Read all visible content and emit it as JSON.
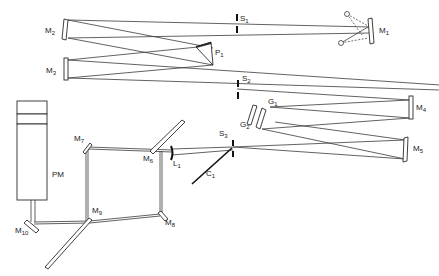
{
  "diagram": {
    "type": "optical-layout",
    "colors": {
      "line": "#3a3a3a",
      "background": "#ffffff",
      "label": "#1a1a1a"
    },
    "components": {
      "M1": {
        "label": "M",
        "sub": "1",
        "kind": "mirror"
      },
      "M2": {
        "label": "M",
        "sub": "2",
        "kind": "mirror"
      },
      "M3": {
        "label": "M",
        "sub": "3",
        "kind": "mirror"
      },
      "M4": {
        "label": "M",
        "sub": "4",
        "kind": "mirror"
      },
      "M5": {
        "label": "M",
        "sub": "5",
        "kind": "mirror"
      },
      "M6": {
        "label": "M",
        "sub": "6",
        "kind": "mirror"
      },
      "M7": {
        "label": "M",
        "sub": "7",
        "kind": "mirror"
      },
      "M8": {
        "label": "M",
        "sub": "8",
        "kind": "mirror"
      },
      "M9": {
        "label": "M",
        "sub": "9",
        "kind": "mirror"
      },
      "M10": {
        "label": "M",
        "sub": "10",
        "kind": "mirror"
      },
      "S1": {
        "label": "S",
        "sub": "1",
        "kind": "slit"
      },
      "S2": {
        "label": "S",
        "sub": "2",
        "kind": "slit"
      },
      "S3": {
        "label": "S",
        "sub": "3",
        "kind": "slit"
      },
      "P1": {
        "label": "P",
        "sub": "1",
        "kind": "prism"
      },
      "G1": {
        "label": "G",
        "sub": "1",
        "kind": "grating"
      },
      "G2": {
        "label": "G",
        "sub": "2",
        "kind": "grating"
      },
      "L1": {
        "label": "L",
        "sub": "1",
        "kind": "lens"
      },
      "C1": {
        "label": "C",
        "sub": "1",
        "kind": "chopper"
      },
      "PM": {
        "label": "PM",
        "kind": "photomultiplier"
      }
    }
  }
}
